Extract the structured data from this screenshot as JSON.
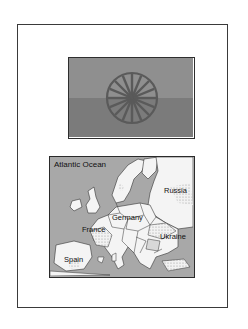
{
  "flag": {
    "colors": {
      "top": "#8f8f8f",
      "bottom": "#7b7b7b",
      "wheel": "#5a5a5a"
    },
    "emblem": "wheel-icon",
    "spokes": 16
  },
  "map": {
    "labels": {
      "ocean": "Atlantic Ocean",
      "russia": "Russia",
      "germany": "Germany",
      "france": "France",
      "ukraine": "Ukraine",
      "spain": "Spain"
    },
    "colors": {
      "water": "#a8a8a8",
      "land": "#f4f4f4",
      "border": "#333333",
      "hatch": "#c9c9c9"
    }
  }
}
